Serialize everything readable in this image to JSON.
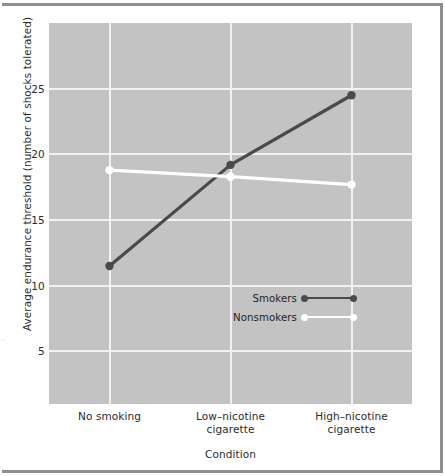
{
  "chart_data": {
    "type": "line",
    "title": "",
    "xlabel": "Condition",
    "ylabel": "Average endurance threshold (number of shocks tolerated)",
    "categories": [
      "No smoking",
      "Low-nicotine cigarette",
      "High-nicotine cigarette"
    ],
    "category_lines": [
      [
        "No smoking"
      ],
      [
        "Low–nicotine",
        "cigarette"
      ],
      [
        "High–nicotine",
        "cigarette"
      ]
    ],
    "series": [
      {
        "name": "Smokers",
        "values": [
          11.5,
          19.2,
          24.5
        ],
        "color": "#4a4a4a"
      },
      {
        "name": "Nonsmokers",
        "values": [
          18.8,
          18.3,
          17.7
        ],
        "color": "#ffffff"
      }
    ],
    "yticks": [
      5,
      10,
      15,
      20,
      25
    ],
    "ytick_labels": [
      "5",
      "10",
      "15",
      "20",
      "25"
    ],
    "ylim": [
      1.0,
      30.0
    ],
    "xlim": [
      -0.5,
      2.5
    ],
    "grid": true,
    "legend_position": "inside-lower-right",
    "plot_background": "#c3c3c3",
    "gridline_color": "#f2f2f2",
    "frame_color": "#8e8e8e"
  },
  "legend": {
    "entries": [
      {
        "label": "Smokers",
        "color": "#4a4a4a"
      },
      {
        "label": "Nonsmokers",
        "color": "#ffffff"
      }
    ]
  },
  "artifact": {
    "marks": "··"
  }
}
